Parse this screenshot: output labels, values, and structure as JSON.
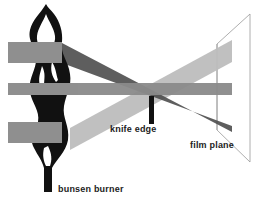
{
  "diagram": {
    "labels": {
      "knife_edge": "knife edge",
      "film_plane": "film plane",
      "bunsen_burner": "bunsen burner"
    },
    "components": [
      "bunsen burner flame",
      "three light beams",
      "knife edge",
      "film plane"
    ],
    "colors": {
      "background": "#ffffff",
      "beam_light": "#b8b8b8",
      "beam_mid": "#8c8c8c",
      "beam_dark": "#555555",
      "flame": "#111111",
      "knife_edge": "#111111",
      "film_plane_outline": "#888888",
      "text": "#222222"
    }
  }
}
